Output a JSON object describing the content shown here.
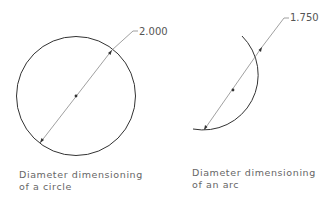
{
  "circle_example": {
    "dimension_value": "2.000",
    "caption_line1": "Diameter dimensioning",
    "caption_line2": "of a circle"
  },
  "arc_example": {
    "dimension_value": "1.750",
    "caption_line1": "Diameter dimensioning",
    "caption_line2": "of an arc"
  }
}
